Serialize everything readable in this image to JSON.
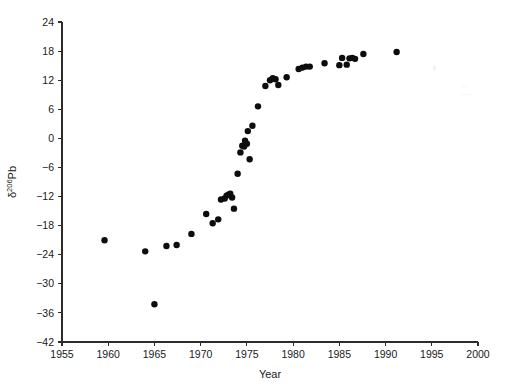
{
  "chart_data": {
    "type": "scatter",
    "title": "",
    "xlabel": "Year",
    "ylabel": "δ206Pb",
    "ylabel_base": "δ",
    "ylabel_superscript": "206",
    "ylabel_suffix": "Pb",
    "xlim": [
      1955,
      2000
    ],
    "ylim": [
      -42,
      24
    ],
    "xticks": [
      1955,
      1960,
      1965,
      1970,
      1975,
      1980,
      1985,
      1990,
      1995,
      2000
    ],
    "xtick_labels": [
      "1955",
      "1960",
      "1965",
      "1970",
      "1975",
      "1980",
      "1985",
      "1990",
      "1995",
      "2000"
    ],
    "yticks": [
      -42,
      -36,
      -30,
      -24,
      -18,
      -12,
      -6,
      0,
      6,
      12,
      18,
      24
    ],
    "ytick_labels": [
      "−42",
      "−36",
      "−30",
      "−24",
      "−18",
      "−12",
      "−6",
      "0",
      "6",
      "12",
      "18",
      "24"
    ],
    "grid": false,
    "legend": null,
    "marker": {
      "shape": "circle",
      "color": "#0d0d0d",
      "size_px": 4.2
    },
    "series": [
      {
        "name": "δ206Pb measurements",
        "x": [
          1959.6,
          1964.0,
          1965.0,
          1966.3,
          1967.4,
          1969.0,
          1970.6,
          1971.3,
          1971.9,
          1972.2,
          1972.6,
          1972.8,
          1973.0,
          1973.2,
          1973.4,
          1973.6,
          1974.0,
          1974.3,
          1974.5,
          1974.7,
          1974.8,
          1975.0,
          1975.1,
          1975.3,
          1975.6,
          1976.2,
          1977.0,
          1977.5,
          1977.8,
          1978.1,
          1978.4,
          1979.3,
          1980.6,
          1981.0,
          1981.4,
          1981.8,
          1983.4,
          1985.0,
          1985.3,
          1985.8,
          1986.1,
          1986.4,
          1986.7,
          1987.6,
          1991.2
        ],
        "y": [
          -21.0,
          -23.3,
          -34.2,
          -22.2,
          -22.0,
          -19.7,
          -15.6,
          -17.5,
          -16.7,
          -12.6,
          -12.4,
          -11.8,
          -11.6,
          -11.4,
          -12.2,
          -14.5,
          -7.3,
          -2.9,
          -1.5,
          -1.7,
          -0.5,
          -1.1,
          1.5,
          -4.3,
          2.6,
          6.6,
          10.8,
          12.0,
          12.4,
          12.2,
          11.0,
          12.6,
          14.3,
          14.6,
          14.8,
          14.8,
          15.5,
          15.1,
          16.6,
          15.2,
          16.5,
          16.6,
          16.4,
          17.4,
          17.8
        ]
      }
    ]
  },
  "layout": {
    "plot_left_px": 62,
    "plot_right_px": 478,
    "plot_top_px": 22,
    "plot_bottom_px": 342
  }
}
